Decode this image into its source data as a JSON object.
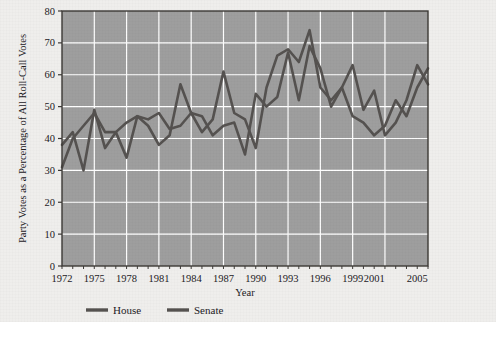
{
  "figure": {
    "background_color": "#efeeec",
    "plot_background_color": "#9e9e9e",
    "gridline_color": "#ffffff",
    "axis_color": "#3c3936",
    "series_color": "#555250"
  },
  "axes": {
    "xlabel": "Year",
    "ylabel": "Party Votes as a Percentage of All Roll-Call Votes",
    "x_ticks": [
      "1972",
      "1975",
      "1978",
      "1981",
      "1984",
      "1987",
      "1990",
      "1993",
      "1996",
      "1999",
      "2001",
      "2005"
    ],
    "y_ticks": [
      "0",
      "10",
      "20",
      "30",
      "40",
      "50",
      "60",
      "70",
      "80"
    ]
  },
  "legend": {
    "items": [
      {
        "label": "House",
        "color": "#555250"
      },
      {
        "label": "Senate",
        "color": "#555250"
      }
    ]
  },
  "chart_data": {
    "type": "line",
    "title": "",
    "xlabel": "Year",
    "ylabel": "Party Votes as a Percentage of All Roll-Call Votes",
    "xlim": [
      1972,
      2006
    ],
    "ylim": [
      0,
      80
    ],
    "grid": true,
    "legend_position": "below-axis-left",
    "x": [
      1972,
      1973,
      1974,
      1975,
      1976,
      1977,
      1978,
      1979,
      1980,
      1981,
      1982,
      1983,
      1984,
      1985,
      1986,
      1987,
      1988,
      1989,
      1990,
      1991,
      1992,
      1993,
      1994,
      1995,
      1996,
      1997,
      1998,
      1999,
      2000,
      2001,
      2002,
      2003,
      2004,
      2005,
      2006
    ],
    "series": [
      {
        "name": "House",
        "color": "#555250",
        "values": [
          38,
          42,
          30,
          49,
          37,
          42,
          34,
          47,
          44,
          38,
          41,
          57,
          48,
          42,
          46,
          61,
          48,
          46,
          37,
          56,
          66,
          68,
          64,
          74,
          56,
          52,
          56,
          47,
          45,
          41,
          44,
          52,
          47,
          56,
          62
        ]
      },
      {
        "name": "Senate",
        "color": "#555250",
        "values": [
          31,
          40,
          44,
          48,
          42,
          42,
          45,
          47,
          46,
          48,
          43,
          44,
          48,
          47,
          41,
          44,
          45,
          35,
          54,
          50,
          53,
          67,
          52,
          69,
          62,
          50,
          56,
          63,
          49,
          55,
          41,
          45,
          52,
          63,
          57
        ]
      }
    ]
  }
}
